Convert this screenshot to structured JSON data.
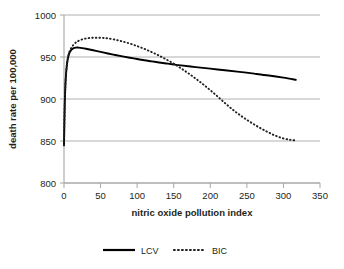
{
  "chart_data": {
    "type": "line",
    "title": "",
    "xlabel": "nitric oxide pollution index",
    "ylabel": "death rate per 100,000",
    "xlim": [
      0,
      350
    ],
    "ylim": [
      800,
      1000
    ],
    "xticks": [
      "0",
      "50",
      "100",
      "150",
      "200",
      "250",
      "300",
      "350"
    ],
    "yticks": [
      "800",
      "850",
      "900",
      "950",
      "1000"
    ],
    "grid": "horizontal",
    "legend_position": "bottom",
    "series": [
      {
        "name": "LCV",
        "style": "solid",
        "color": "#000000",
        "x": [
          0,
          1,
          2,
          3,
          4,
          5,
          6,
          7,
          8,
          10,
          12,
          14,
          16,
          18,
          20,
          25,
          30,
          40,
          50,
          60,
          70,
          80,
          90,
          100,
          110,
          120,
          130,
          140,
          150,
          160,
          180,
          200,
          220,
          240,
          260,
          280,
          300,
          317
        ],
        "y": [
          845.0,
          893.0,
          918.0,
          932.0,
          941.0,
          947.0,
          951.0,
          954.0,
          956.0,
          958.5,
          960.0,
          960.8,
          961.2,
          961.3,
          961.2,
          960.6,
          959.8,
          958.0,
          956.1,
          954.2,
          952.4,
          950.7,
          949.1,
          947.6,
          946.1,
          944.8,
          943.5,
          942.3,
          941.1,
          940.0,
          938.0,
          936.1,
          934.2,
          932.3,
          930.2,
          928.0,
          925.4,
          922.8
        ]
      },
      {
        "name": "BIC",
        "style": "dotted",
        "color": "#231f20",
        "x": [
          0,
          1,
          2,
          3,
          4,
          5,
          6,
          7,
          8,
          10,
          12,
          15,
          18,
          20,
          25,
          30,
          35,
          40,
          45,
          50,
          55,
          60,
          70,
          80,
          90,
          100,
          110,
          120,
          130,
          140,
          150,
          160,
          170,
          180,
          190,
          200,
          210,
          220,
          230,
          240,
          250,
          260,
          270,
          280,
          290,
          300,
          310,
          317
        ],
        "y": [
          845.0,
          893.0,
          918.0,
          932.0,
          941.0,
          947.0,
          951.5,
          955.0,
          957.5,
          961.0,
          963.5,
          966.3,
          968.3,
          969.3,
          971.0,
          972.0,
          972.6,
          972.9,
          973.0,
          972.9,
          972.6,
          972.1,
          970.6,
          968.5,
          966.0,
          963.0,
          959.6,
          955.8,
          951.6,
          947.0,
          942.0,
          936.5,
          930.6,
          924.3,
          917.6,
          910.5,
          903.0,
          895.2,
          887.8,
          881.2,
          875.2,
          869.7,
          864.6,
          860.0,
          856.0,
          853.0,
          851.3,
          850.8
        ]
      }
    ],
    "annotations": {
      "lcv_peak_value": 961,
      "lcv_peak_x": 18,
      "bic_peak_value": 973,
      "bic_peak_x": 45,
      "crossing_x": 133,
      "crossing_y": 943,
      "start_value": 845,
      "lcv_end_value": 923,
      "bic_end_value": 851
    }
  },
  "legend": {
    "items": [
      {
        "label": "LCV",
        "style": "solid"
      },
      {
        "label": "BIC",
        "style": "dotted"
      }
    ]
  }
}
